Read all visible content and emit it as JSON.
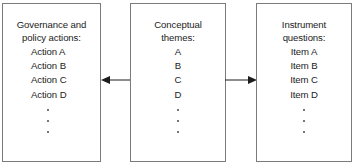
{
  "diagram": {
    "boxes": [
      {
        "id": "governance",
        "title_line1": "Governance and",
        "title_line2": "policy actions:",
        "items": [
          "Action A",
          "Action B",
          "Action C",
          "Action D"
        ],
        "ellipsis_dots": 3
      },
      {
        "id": "themes",
        "title_line1": "Conceptual",
        "title_line2": "themes:",
        "items": [
          "A",
          "B",
          "C",
          "D"
        ],
        "ellipsis_dots": 3
      },
      {
        "id": "questions",
        "title_line1": "Instrument",
        "title_line2": "questions:",
        "items": [
          "Item A",
          "Item B",
          "Item C",
          "Item D"
        ],
        "ellipsis_dots": 3
      }
    ],
    "connectors": [
      {
        "id": "left",
        "direction": "left",
        "from": "themes",
        "to": "governance"
      },
      {
        "id": "right",
        "direction": "right",
        "from": "themes",
        "to": "questions"
      }
    ],
    "colors": {
      "box_border": "#7b7b7b",
      "text": "#1c1c1c",
      "connector": "#1c1c1c",
      "background": "#ffffff"
    }
  }
}
